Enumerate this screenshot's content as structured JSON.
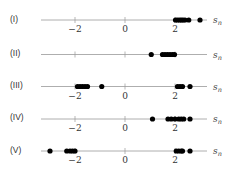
{
  "chart_data": {
    "type": "scatter",
    "title": "",
    "xlabel": "s_n",
    "xlabel_display": "s",
    "xlabel_sub": "n",
    "xlim": [
      -3.4,
      3.3
    ],
    "tick_values": [
      -2,
      0,
      2
    ],
    "tick_labels": [
      "−2",
      "0",
      "2"
    ],
    "grid": false,
    "series": [
      {
        "name": "(I)",
        "show_ticks": true,
        "values": [
          2.02,
          2.1,
          2.18,
          2.25,
          2.32,
          2.4,
          2.55,
          3.0
        ]
      },
      {
        "name": "(II)",
        "show_ticks": false,
        "values": [
          1.05,
          1.5,
          1.6,
          1.7,
          1.8,
          1.9,
          1.98
        ]
      },
      {
        "name": "(III)",
        "show_ticks": true,
        "values": [
          -1.9,
          -1.8,
          -1.7,
          -1.6,
          -1.5,
          -0.93,
          2.1,
          2.2,
          2.3,
          2.6
        ]
      },
      {
        "name": "(IV)",
        "show_ticks": true,
        "values": [
          1.1,
          1.72,
          1.85,
          2.0,
          2.15,
          2.25,
          2.35,
          2.6
        ]
      },
      {
        "name": "(V)",
        "show_ticks": true,
        "values": [
          -3.0,
          -2.33,
          -2.2,
          -2.1,
          -2.0,
          2.05,
          2.15,
          2.25,
          2.3,
          2.6
        ]
      }
    ]
  }
}
